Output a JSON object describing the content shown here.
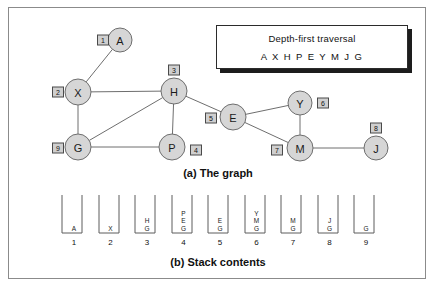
{
  "figure": {
    "caption_a": "(a) The graph",
    "caption_b": "(b) Stack contents"
  },
  "traversal_box": {
    "title": "Depth-first traversal",
    "sequence": "A X H P E Y M  J G"
  },
  "graph": {
    "nodes": [
      {
        "id": "A",
        "label": "A",
        "cx": 120,
        "cy": 40,
        "r": 12,
        "badge": "1",
        "badge_x": 103,
        "badge_y": 40
      },
      {
        "id": "X",
        "label": "X",
        "cx": 78,
        "cy": 92,
        "r": 13,
        "badge": "2",
        "badge_x": 58,
        "badge_y": 92
      },
      {
        "id": "H",
        "label": "H",
        "cx": 174,
        "cy": 91,
        "r": 13,
        "badge": "3",
        "badge_x": 174,
        "badge_y": 70
      },
      {
        "id": "P",
        "label": "P",
        "cx": 172,
        "cy": 147,
        "r": 13,
        "badge": "4",
        "badge_x": 196,
        "badge_y": 150
      },
      {
        "id": "E",
        "label": "E",
        "cx": 233,
        "cy": 117,
        "r": 13,
        "badge": "5",
        "badge_x": 211,
        "badge_y": 118
      },
      {
        "id": "Y",
        "label": "Y",
        "cx": 300,
        "cy": 103,
        "r": 12,
        "badge": "6",
        "badge_x": 323,
        "badge_y": 103
      },
      {
        "id": "M",
        "label": "M",
        "cx": 300,
        "cy": 148,
        "r": 13,
        "badge": "7",
        "badge_x": 277,
        "badge_y": 150
      },
      {
        "id": "J",
        "label": "J",
        "cx": 376,
        "cy": 148,
        "r": 12,
        "badge": "8",
        "badge_x": 376,
        "badge_y": 128
      },
      {
        "id": "G",
        "label": "G",
        "cx": 78,
        "cy": 147,
        "r": 13,
        "badge": "9",
        "badge_x": 58,
        "badge_y": 148
      }
    ],
    "edges": [
      {
        "from": "A",
        "to": "X"
      },
      {
        "from": "X",
        "to": "H"
      },
      {
        "from": "X",
        "to": "G"
      },
      {
        "from": "G",
        "to": "H"
      },
      {
        "from": "G",
        "to": "P"
      },
      {
        "from": "H",
        "to": "P"
      },
      {
        "from": "H",
        "to": "E"
      },
      {
        "from": "E",
        "to": "Y"
      },
      {
        "from": "E",
        "to": "M"
      },
      {
        "from": "Y",
        "to": "M"
      },
      {
        "from": "M",
        "to": "J"
      }
    ]
  },
  "stacks": [
    {
      "index": "1",
      "items": [
        "A"
      ]
    },
    {
      "index": "2",
      "items": [
        "X"
      ]
    },
    {
      "index": "3",
      "items": [
        "H",
        "G"
      ]
    },
    {
      "index": "4",
      "items": [
        "P",
        "E",
        "G"
      ]
    },
    {
      "index": "5",
      "items": [
        "E",
        "G"
      ]
    },
    {
      "index": "6",
      "items": [
        "Y",
        "M",
        "G"
      ]
    },
    {
      "index": "7",
      "items": [
        "M",
        "G"
      ]
    },
    {
      "index": "8",
      "items": [
        "J",
        "G"
      ]
    },
    {
      "index": "9",
      "items": [
        "G"
      ]
    }
  ],
  "colors": {
    "node_fill": "#d6d6d6",
    "node_stroke": "#6e6e6e",
    "badge_fill": "#cfcfcf",
    "badge_stroke": "#4a4a4a",
    "frame_stroke": "#8b8b8b",
    "text": "#111111"
  }
}
